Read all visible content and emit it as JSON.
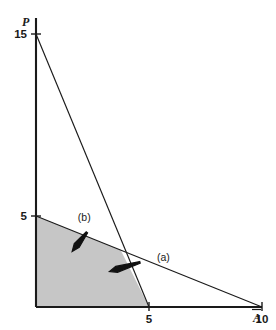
{
  "chart_data": {
    "type": "line",
    "title": "",
    "subtitle": "",
    "xlabel": "A",
    "xlabel_display": "Ā",
    "ylabel": "P",
    "xlim": [
      0,
      13
    ],
    "ylim": [
      0,
      17
    ],
    "grid": false,
    "legend_position": "none",
    "x_ticks": [
      {
        "value": 5,
        "label": "5"
      },
      {
        "value": 10,
        "label": "10"
      }
    ],
    "y_ticks": [
      {
        "value": 5,
        "label": "5"
      },
      {
        "value": 15,
        "label": "15"
      }
    ],
    "series": [
      {
        "name": "(a)",
        "note": "steep constraint line",
        "x": [
          0,
          5
        ],
        "values": [
          15,
          0
        ],
        "intercepts": {
          "y": 15,
          "x": 5
        }
      },
      {
        "name": "(b)",
        "note": "shallow constraint line",
        "x": [
          0,
          10
        ],
        "values": [
          5,
          0
        ],
        "intercepts": {
          "y": 5,
          "x": 10
        }
      }
    ],
    "shaded_region": {
      "name": "feasible-region",
      "fill_color": "#c6c6c6",
      "vertices": [
        {
          "x": 0,
          "y": 0
        },
        {
          "x": 0,
          "y": 5
        },
        {
          "x": 3.75,
          "y": 3.125
        },
        {
          "x": 5,
          "y": 0
        }
      ]
    },
    "annotations": [
      {
        "id": "a",
        "label": "(a)",
        "label_x": 5.35,
        "label_y": 2.55,
        "arrow_from_x": 4.6,
        "arrow_from_y": 2.45,
        "arrow_to_x": 3.25,
        "arrow_to_y": 1.95,
        "points_to": "steep constraint line (a)"
      },
      {
        "id": "b",
        "label": "(b)",
        "label_x": 1.85,
        "label_y": 4.75,
        "arrow_from_x": 2.25,
        "arrow_from_y": 4.1,
        "arrow_to_x": 1.6,
        "arrow_to_y": 3.05,
        "points_to": "shallow constraint line (b)"
      }
    ]
  },
  "colors": {
    "background": "#ffffff",
    "axis": "#1a1a1a",
    "line": "#1a1a1a",
    "region": "#c6c6c6",
    "text": "#1a1a1a"
  }
}
